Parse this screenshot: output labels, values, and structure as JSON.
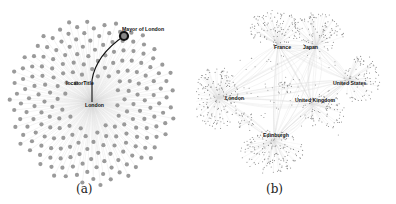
{
  "figure": {
    "panels": [
      {
        "id": "a",
        "caption": "(a)",
        "layout": "radial star graph",
        "hub_label": "London",
        "edge_label": "locatorTitle",
        "highlighted_node_label": "Mayor of London",
        "node_color": "#9a9a9a",
        "edge_color": "#cfcfcf",
        "highlight_color": "#111111"
      },
      {
        "id": "b",
        "caption": "(b)",
        "layout": "multi-cluster force-directed graph",
        "cluster_labels": [
          "France",
          "Japan",
          "United States",
          "London",
          "United Kingdom",
          "Edinburgh"
        ],
        "node_color": "#8a8a8a",
        "edge_color": "#dddddd"
      }
    ]
  }
}
